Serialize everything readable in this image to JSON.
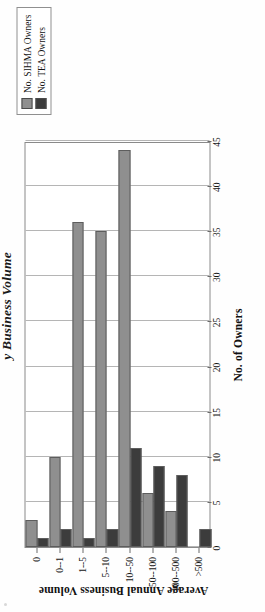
{
  "figure": {
    "title": "y Business Volume",
    "title_full_visible": "y Business Volume"
  },
  "legend": {
    "items": [
      {
        "label": "No. SIHMA Owners",
        "color": "#8f8f8f"
      },
      {
        "label": "No. TEA Owners",
        "color": "#3c3c3c"
      }
    ]
  },
  "axes": {
    "value_axis_title": "No. of Owners",
    "category_axis_title": "Average Annual Business Volume",
    "value_ticks": [
      "0",
      "5",
      "10",
      "15",
      "20",
      "25",
      "30",
      "35",
      "40",
      "45"
    ],
    "categories": [
      "0",
      "0--1",
      "1--5",
      "5--10",
      "10--50",
      "50--100",
      "100--500",
      ">500"
    ]
  },
  "chart_data": {
    "type": "bar",
    "orientation": "vertical-printed-rotated",
    "title": "y Business Volume",
    "xlabel": "Average Annual Business Volume",
    "ylabel": "No. of Owners",
    "categories": [
      "0",
      "0--1",
      "1--5",
      "5--10",
      "10--50",
      "50--100",
      "100--500",
      ">500"
    ],
    "series": [
      {
        "name": "No. SIHMA Owners",
        "color": "#8f8f8f",
        "values": [
          3,
          10,
          36,
          35,
          44,
          6,
          4,
          0
        ]
      },
      {
        "name": "No. TEA Owners",
        "color": "#3c3c3c",
        "values": [
          1,
          2,
          1,
          2,
          11,
          9,
          8,
          2
        ]
      }
    ],
    "ylim": [
      0,
      45
    ],
    "ytick_step": 5,
    "grid": true,
    "legend_position": "top-right"
  }
}
